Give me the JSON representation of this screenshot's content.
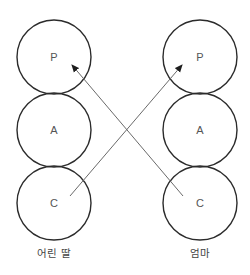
{
  "diagram": {
    "type": "ego-state transaction diagram",
    "columns": [
      {
        "id": "left",
        "caption": "어린 딸",
        "nodes": [
          {
            "id": "P",
            "label": "P"
          },
          {
            "id": "A",
            "label": "A"
          },
          {
            "id": "C",
            "label": "C"
          }
        ]
      },
      {
        "id": "right",
        "caption": "엄마",
        "nodes": [
          {
            "id": "P",
            "label": "P"
          },
          {
            "id": "A",
            "label": "A"
          },
          {
            "id": "C",
            "label": "C"
          }
        ]
      }
    ],
    "arrows": [
      {
        "from": "left.C",
        "to": "right.P"
      },
      {
        "from": "right.C",
        "to": "left.P"
      }
    ],
    "colors": {
      "circle_stroke": "#2b2b2b",
      "arrow": "#6a6a6a",
      "text": "#555555"
    }
  }
}
